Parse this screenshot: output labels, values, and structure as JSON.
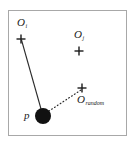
{
  "figure": {
    "type": "diagram",
    "background_color": "#ffffff",
    "frame_color": "#a8a8a8",
    "ink_color": "#1a1a1a"
  },
  "labels": {
    "o_i": {
      "base": "O",
      "sub": "i"
    },
    "o_j": {
      "base": "O",
      "sub": "j"
    },
    "o_random": {
      "base": "O",
      "sub": "random"
    },
    "p": {
      "base": "p",
      "sub": ""
    }
  },
  "markers": [
    {
      "name": "o_i",
      "glyph": "plus",
      "x": 21,
      "y": 39
    },
    {
      "name": "o_j",
      "glyph": "plus",
      "x": 79,
      "y": 51
    },
    {
      "name": "o_random",
      "glyph": "plus",
      "x": 82,
      "y": 88
    },
    {
      "name": "p",
      "glyph": "filled-circle",
      "x": 43,
      "y": 116,
      "radius": 8
    }
  ],
  "edges": [
    {
      "name": "p-to-oi",
      "style": "solid",
      "from": "p",
      "to": "o_i"
    },
    {
      "name": "p-to-orandom",
      "style": "dotted",
      "from": "p",
      "to": "o_random"
    }
  ]
}
